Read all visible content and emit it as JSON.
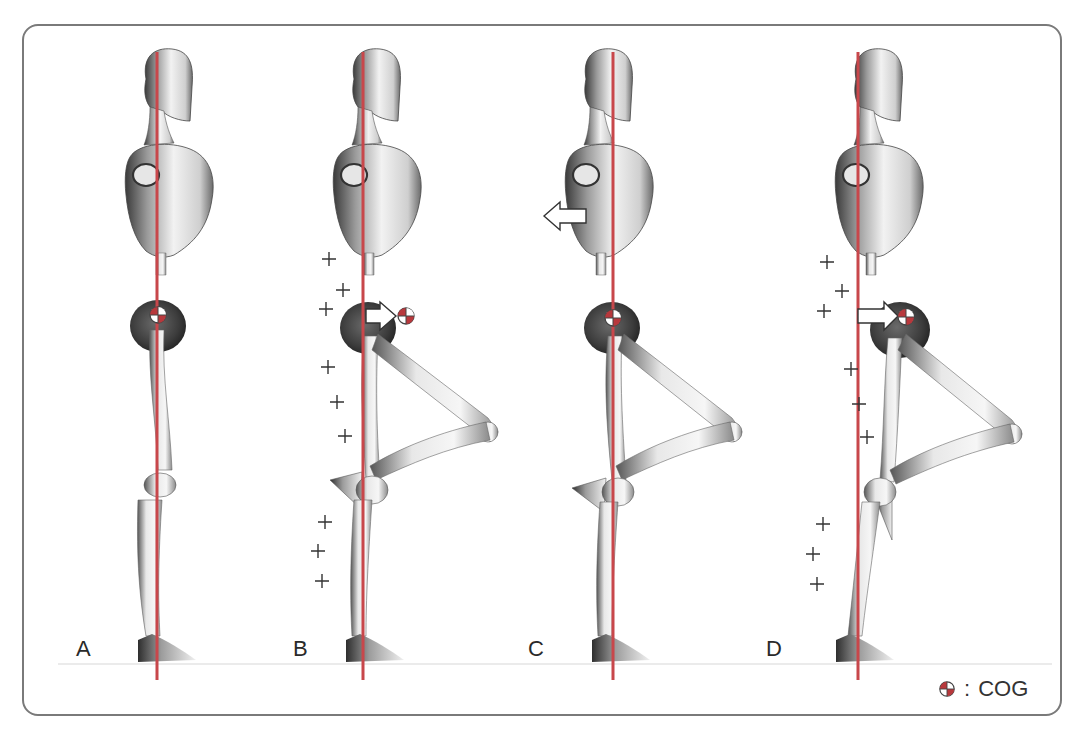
{
  "figure": {
    "panels": [
      {
        "id": "A",
        "label": "A",
        "posture": "standing upright",
        "cog_shift": "none",
        "arrow": null,
        "plus_marks": 0
      },
      {
        "id": "B",
        "label": "B",
        "posture": "one leg raised, bent knee",
        "cog_shift": "forward (pelvis)",
        "arrow": "right arrow at pelvis pointing to COG",
        "plus_marks": 9
      },
      {
        "id": "C",
        "label": "C",
        "posture": "one leg raised, upper body leaning back",
        "cog_shift": "none (compensated)",
        "arrow": "left arrow at chest",
        "plus_marks": 0
      },
      {
        "id": "D",
        "label": "D",
        "posture": "one leg raised, body tilted",
        "cog_shift": "forward (pelvis)",
        "arrow": "right arrow at pelvis pointing to COG",
        "plus_marks": 9
      }
    ],
    "legend": {
      "symbol": "cog-symbol",
      "separator": ":",
      "text": "COG"
    },
    "colors": {
      "center_line": "#c8474b",
      "cog_red": "#b8383c",
      "border": "#7a7a7a",
      "label_text": "#2a2a2a"
    }
  }
}
